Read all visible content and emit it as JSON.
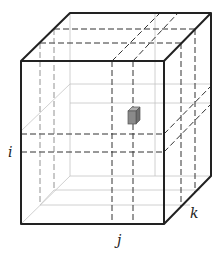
{
  "diagram": {
    "type": "3d-grid-cube",
    "labels": {
      "i": "i",
      "j": "j",
      "k": "k"
    },
    "colors": {
      "edge": "#222222",
      "dash": "#333333",
      "faint": "#bbbbbb",
      "cell": "#8a8a8a"
    },
    "highlighted_cell": "cell (i,j,k)"
  }
}
